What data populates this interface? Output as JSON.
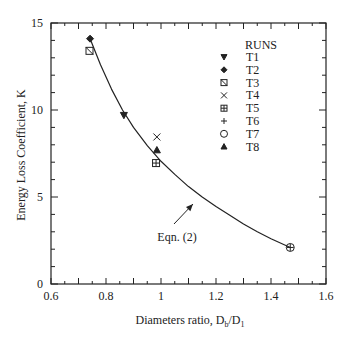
{
  "chart_data": {
    "type": "scatter",
    "title": "",
    "xlabel": "Diameters ratio, D",
    "xlabel_sub1": "b",
    "xlabel_mid": "/D",
    "xlabel_sub2": "1",
    "ylabel": "Energy Loss Coefficient, K",
    "xlim": [
      0.6,
      1.6
    ],
    "ylim": [
      0,
      15
    ],
    "x_ticks": [
      0.6,
      0.8,
      1,
      1.2,
      1.4,
      1.6
    ],
    "x_tick_labels": [
      "0.6",
      "0.8",
      "1",
      "1.2",
      "1.4",
      "1.6"
    ],
    "y_ticks": [
      0,
      5,
      10,
      15
    ],
    "y_tick_labels": [
      "0",
      "5",
      "10",
      "15"
    ],
    "x_minor_step": 0.05,
    "y_minor_step": 1,
    "grid": false,
    "legend": {
      "title": "RUNS",
      "position": "upper right",
      "entries": [
        {
          "label": "T1",
          "marker": "triangle-down-filled"
        },
        {
          "label": "T2",
          "marker": "diamond-filled"
        },
        {
          "label": "T3",
          "marker": "square-slash"
        },
        {
          "label": "T4",
          "marker": "x"
        },
        {
          "label": "T5",
          "marker": "square-plus"
        },
        {
          "label": "T6",
          "marker": "plus"
        },
        {
          "label": "T7",
          "marker": "circle-open"
        },
        {
          "label": "T8",
          "marker": "triangle-up-filled"
        }
      ]
    },
    "series": [
      {
        "name": "T1",
        "marker": "triangle-down-filled",
        "x": [
          0.865
        ],
        "y": [
          9.7
        ]
      },
      {
        "name": "T2",
        "marker": "diamond-filled",
        "x": [
          0.742
        ],
        "y": [
          14.1
        ]
      },
      {
        "name": "T3",
        "marker": "square-slash",
        "x": [
          0.74
        ],
        "y": [
          13.4
        ]
      },
      {
        "name": "T4",
        "marker": "x",
        "x": [
          0.985
        ],
        "y": [
          8.45
        ]
      },
      {
        "name": "T5",
        "marker": "square-plus",
        "x": [
          0.982
        ],
        "y": [
          6.95
        ]
      },
      {
        "name": "T6",
        "marker": "plus",
        "x": [
          1.47
        ],
        "y": [
          2.1
        ]
      },
      {
        "name": "T7",
        "marker": "circle-open",
        "x": [
          1.47
        ],
        "y": [
          2.1
        ]
      },
      {
        "name": "T8",
        "marker": "triangle-up-filled",
        "x": [
          0.985
        ],
        "y": [
          7.7
        ]
      }
    ],
    "curve": {
      "name": "Eqn. (2)",
      "x": [
        0.742,
        0.78,
        0.82,
        0.86,
        0.9,
        0.95,
        1.0,
        1.05,
        1.1,
        1.15,
        1.2,
        1.25,
        1.3,
        1.35,
        1.4,
        1.47
      ],
      "y": [
        14.1,
        12.6,
        11.2,
        10.0,
        9.0,
        7.95,
        7.05,
        6.3,
        5.6,
        5.0,
        4.45,
        3.95,
        3.45,
        3.0,
        2.6,
        2.1
      ]
    },
    "annotations": [
      {
        "text": "Eqn. (2)",
        "x": 1.05,
        "y": 2.7,
        "arrow_to": [
          1.13,
          4.7
        ]
      }
    ]
  }
}
